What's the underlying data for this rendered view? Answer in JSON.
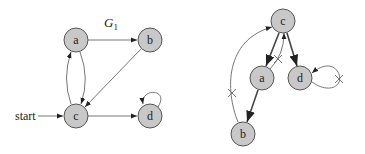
{
  "left_graph": {
    "title": "G",
    "title_subscript": "1",
    "start_label": "start",
    "nodes": [
      {
        "id": "a",
        "label": "a",
        "x": 76,
        "y": 40
      },
      {
        "id": "b",
        "label": "b",
        "x": 150,
        "y": 40
      },
      {
        "id": "c",
        "label": "c",
        "x": 76,
        "y": 116
      },
      {
        "id": "d",
        "label": "d",
        "x": 150,
        "y": 116
      }
    ],
    "edges": [
      {
        "from": "a",
        "to": "b"
      },
      {
        "from": "b",
        "to": "c"
      },
      {
        "from": "a",
        "to": "c"
      },
      {
        "from": "c",
        "to": "a"
      },
      {
        "from": "c",
        "to": "d"
      },
      {
        "from": "d",
        "to": "d"
      },
      {
        "from": "start",
        "to": "c"
      }
    ]
  },
  "right_graph": {
    "nodes": [
      {
        "id": "c",
        "label": "c",
        "x": 283,
        "y": 21
      },
      {
        "id": "a",
        "label": "a",
        "x": 262,
        "y": 78
      },
      {
        "id": "d",
        "label": "d",
        "x": 300,
        "y": 78
      },
      {
        "id": "b",
        "label": "b",
        "x": 243,
        "y": 134
      }
    ],
    "tree_edges": [
      {
        "from": "c",
        "to": "a"
      },
      {
        "from": "c",
        "to": "d"
      },
      {
        "from": "a",
        "to": "b"
      }
    ],
    "back_edges_crossed": [
      {
        "from": "a",
        "to": "c"
      },
      {
        "from": "b",
        "to": "c"
      },
      {
        "from": "d",
        "to": "d"
      }
    ]
  },
  "colors": {
    "node_fill": "#c8c8c8",
    "node_stroke": "#555555",
    "edge": "#666666",
    "tree_edge": "#444444"
  }
}
